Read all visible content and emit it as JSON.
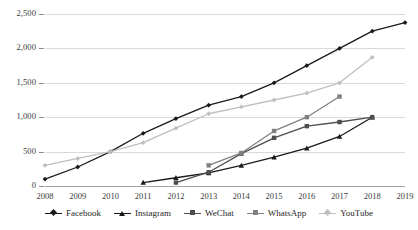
{
  "chart_data": {
    "type": "line",
    "title": "",
    "subtitle": "",
    "xlabel": "",
    "ylabel": "",
    "x": [
      2008,
      2009,
      2010,
      2011,
      2012,
      2013,
      2014,
      2015,
      2016,
      2017,
      2018,
      2019
    ],
    "xtick_labels": [
      "2008",
      "2009",
      "2010",
      "2011",
      "2012",
      "2013",
      "2014",
      "2015",
      "2016",
      "2017",
      "2018",
      "2019"
    ],
    "ytick_labels": [
      "0",
      "500",
      "1,000",
      "1,500",
      "2,000",
      "2,500"
    ],
    "ytick_values": [
      0,
      500,
      1000,
      1500,
      2000,
      2500
    ],
    "ylim": [
      0,
      2500
    ],
    "xlim": [
      2008,
      2019
    ],
    "grid": true,
    "legend_position": "bottom",
    "series": [
      {
        "name": "Facebook",
        "color": "#1a1a1a",
        "marker": "diamond",
        "x": [
          2008,
          2009,
          2010,
          2011,
          2012,
          2013,
          2014,
          2015,
          2016,
          2017,
          2018,
          2019
        ],
        "values": [
          100,
          276,
          500,
          766,
          980,
          1175,
          1300,
          1500,
          1750,
          2000,
          2250,
          2375
        ]
      },
      {
        "name": "Instagram",
        "color": "#1a1a1a",
        "marker": "triangle",
        "x": [
          2011,
          2012,
          2013,
          2014,
          2015,
          2016,
          2017,
          2018
        ],
        "values": [
          50,
          120,
          190,
          300,
          420,
          550,
          720,
          1000
        ]
      },
      {
        "name": "WeChat",
        "color": "#4d4d4d",
        "marker": "square",
        "x": [
          2012,
          2013,
          2014,
          2015,
          2016,
          2017,
          2018
        ],
        "values": [
          50,
          200,
          470,
          700,
          870,
          930,
          1000
        ]
      },
      {
        "name": "WhatsApp",
        "color": "#808080",
        "marker": "square",
        "x": [
          2013,
          2014,
          2015,
          2016,
          2017
        ],
        "values": [
          300,
          480,
          800,
          1000,
          1300
        ]
      },
      {
        "name": "YouTube",
        "color": "#bfbfbf",
        "marker": "diamond",
        "x": [
          2008,
          2009,
          2010,
          2011,
          2012,
          2013,
          2014,
          2015,
          2016,
          2017,
          2018
        ],
        "values": [
          300,
          400,
          500,
          630,
          840,
          1050,
          1150,
          1250,
          1350,
          1500,
          1870
        ]
      }
    ]
  }
}
